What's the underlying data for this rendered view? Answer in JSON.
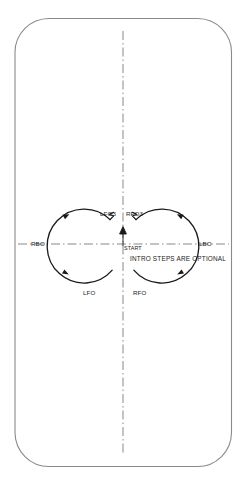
{
  "diagram": {
    "rink": {
      "shape": "rounded-rectangle",
      "fill_color": "#ffffff",
      "stroke_color": "#8a8a8a"
    },
    "axes": {
      "vertical_label": "long-axis",
      "horizontal_label": "short-axis",
      "line_style": "dash-dot",
      "color": "#6b6b6b"
    },
    "start": {
      "label": "START",
      "direction": "up"
    },
    "note": "INTRO STEPS ARE OPTIONAL",
    "edge_labels": [
      {
        "id": "rbo",
        "text": "RBO",
        "meaning": "right-back-outside"
      },
      {
        "id": "lfo3",
        "text": "LFO3",
        "meaning": "left-forward-outside-three-turn"
      },
      {
        "id": "rfo3",
        "text": "RFO3",
        "meaning": "right-forward-outside-three-turn"
      },
      {
        "id": "lbo",
        "text": "LBO",
        "meaning": "left-back-outside"
      },
      {
        "id": "lfo",
        "text": "LFO",
        "meaning": "left-forward-outside"
      },
      {
        "id": "rfo",
        "text": "RFO",
        "meaning": "right-forward-outside"
      }
    ],
    "trace_color": "#1a1a1a"
  }
}
